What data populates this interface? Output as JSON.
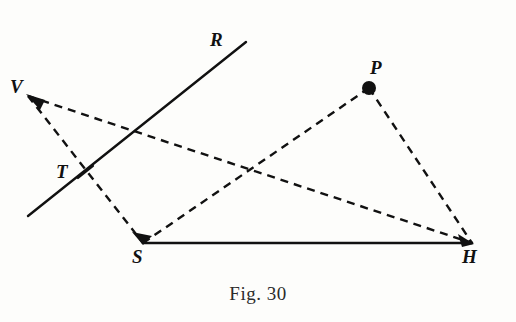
{
  "figure": {
    "caption": "Fig. 30",
    "background_color": "#fdfdfb",
    "ink_color": "#111111",
    "labels": {
      "R": "R",
      "V": "V",
      "T": "T",
      "S": "S",
      "P": "P",
      "H": "H"
    },
    "label_positions": {
      "R": {
        "x": 210,
        "y": 30
      },
      "V": {
        "x": 10,
        "y": 77
      },
      "T": {
        "x": 56,
        "y": 162
      },
      "S": {
        "x": 132,
        "y": 247
      },
      "P": {
        "x": 370,
        "y": 58
      },
      "H": {
        "x": 462,
        "y": 247
      }
    },
    "points": {
      "R": {
        "x": 246,
        "y": 42
      },
      "V": {
        "x": 28,
        "y": 96
      },
      "T": {
        "x": 85,
        "y": 172
      },
      "S": {
        "x": 143,
        "y": 243
      },
      "P": {
        "x": 369,
        "y": 88
      },
      "H": {
        "x": 472,
        "y": 243
      },
      "line_ray_lower_end": {
        "x": 28,
        "y": 216
      }
    },
    "solid_segments": [
      {
        "name": "ray-TR",
        "from": "line_ray_lower_end",
        "to": "R"
      },
      {
        "name": "segment-SH",
        "from": "S",
        "to": "H"
      }
    ],
    "dashed_segments": [
      {
        "name": "segment-VH",
        "from": "V",
        "to": "H"
      },
      {
        "name": "segment-VS",
        "from": "V",
        "to": "S"
      },
      {
        "name": "segment-SP",
        "from": "S",
        "to": "P"
      },
      {
        "name": "segment-PH",
        "from": "P",
        "to": "H"
      }
    ],
    "marked_points": [
      {
        "name": "point-P",
        "at": "P",
        "radius": 7,
        "style": "filled-dot"
      }
    ],
    "tick_marks": [
      {
        "name": "tick-T",
        "at": "T"
      }
    ],
    "arrow_heads": [
      {
        "name": "arrowhead-at-V",
        "at": "V"
      },
      {
        "name": "arrowhead-at-S",
        "at": "S"
      },
      {
        "name": "arrowhead-at-H",
        "at": "H"
      }
    ],
    "stroke_widths": {
      "solid": 2.4,
      "dashed": 2.4
    },
    "dash_pattern": "8 6"
  }
}
